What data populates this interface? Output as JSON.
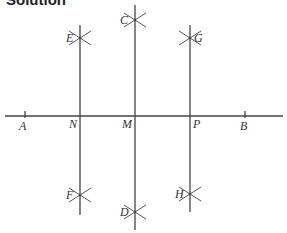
{
  "title": "Solution",
  "colors": {
    "line": "#444444",
    "arc": "#555555",
    "text": "#333333",
    "background": "#ffffff"
  },
  "diagram": {
    "baseline": {
      "x1": 5,
      "x2": 283,
      "y": 116
    },
    "ticks": [
      {
        "id": "A",
        "x": 25
      },
      {
        "id": "B",
        "x": 245
      }
    ],
    "perpendiculars": [
      {
        "id": "N",
        "x": 80,
        "y1": 25,
        "y2": 215
      },
      {
        "id": "M",
        "x": 135,
        "y1": 5,
        "y2": 230
      },
      {
        "id": "P",
        "x": 190,
        "y1": 25,
        "y2": 212
      }
    ],
    "arc_crossings": [
      {
        "id": "E",
        "x": 80,
        "y": 38
      },
      {
        "id": "F",
        "x": 80,
        "y": 195
      },
      {
        "id": "C",
        "x": 135,
        "y": 20
      },
      {
        "id": "D",
        "x": 135,
        "y": 212
      },
      {
        "id": "G",
        "x": 190,
        "y": 38
      },
      {
        "id": "H",
        "x": 190,
        "y": 194
      }
    ],
    "labels": [
      {
        "text": "A",
        "x": 19,
        "y": 130
      },
      {
        "text": "N",
        "x": 69,
        "y": 128
      },
      {
        "text": "M",
        "x": 122,
        "y": 128
      },
      {
        "text": "P",
        "x": 193,
        "y": 128
      },
      {
        "text": "B",
        "x": 240,
        "y": 130
      },
      {
        "text": "E",
        "x": 66,
        "y": 42
      },
      {
        "text": "C",
        "x": 120,
        "y": 24
      },
      {
        "text": "G",
        "x": 194,
        "y": 42
      },
      {
        "text": "F",
        "x": 66,
        "y": 199
      },
      {
        "text": "D",
        "x": 120,
        "y": 216
      },
      {
        "text": "H",
        "x": 175,
        "y": 198
      }
    ]
  }
}
